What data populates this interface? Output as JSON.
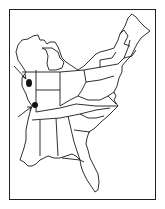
{
  "map": {
    "region": "Eastern United States",
    "style": "black outline line drawing on white",
    "colors": {
      "outline": "#1a1a1a",
      "background": "#ffffff",
      "marker": "#111111"
    },
    "markers": [
      {
        "id": "marker-1",
        "type": "filled-dot",
        "location": "west-central Illinois",
        "x": 29,
        "y": 83
      },
      {
        "id": "marker-2",
        "type": "filled-dot",
        "location": "southern Illinois",
        "x": 35,
        "y": 105
      }
    ],
    "arrows": [
      {
        "id": "arrow-1",
        "points_to": "marker-1"
      },
      {
        "id": "arrow-2",
        "points_to": "marker-2"
      }
    ]
  }
}
